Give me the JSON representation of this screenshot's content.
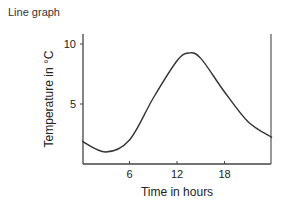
{
  "header": {
    "title": "Line graph"
  },
  "chart_data": {
    "type": "line",
    "title": "Line graph",
    "xlabel": "Time in hours",
    "ylabel": "Temperature in °C",
    "x_ticks": [
      6,
      12,
      18
    ],
    "y_ticks": [
      5,
      10
    ],
    "xlim": [
      0,
      24
    ],
    "ylim": [
      0,
      10.8
    ],
    "grid": false,
    "legend": null,
    "series": [
      {
        "name": "Temperature",
        "x": [
          0,
          3,
          6,
          9,
          12,
          13.5,
          15,
          18,
          21,
          24
        ],
        "values": [
          1.9,
          1.0,
          2.0,
          5.5,
          8.6,
          9.25,
          8.8,
          6.0,
          3.5,
          2.2
        ]
      }
    ],
    "colors": {
      "line": "#333333",
      "axis": "#444444"
    }
  }
}
